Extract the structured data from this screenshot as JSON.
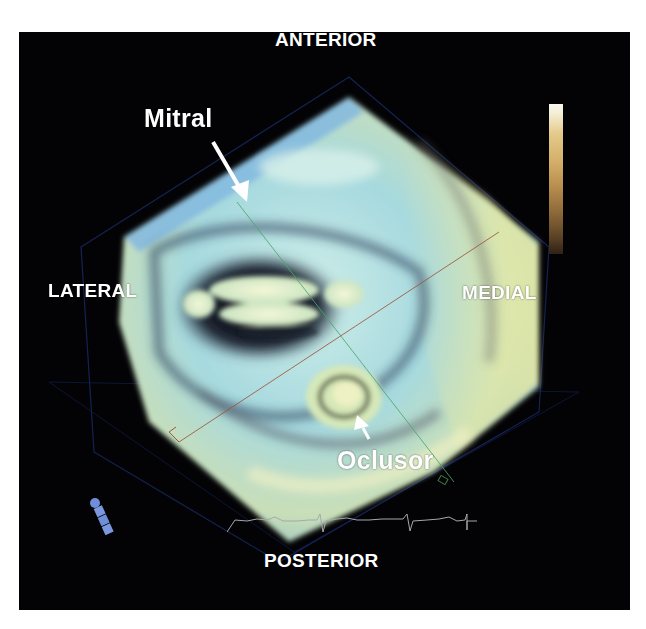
{
  "figure": {
    "background_color": "#030305",
    "labels": {
      "anterior": "ANTERIOR",
      "posterior": "POSTERIOR",
      "lateral": "LATERAL",
      "medial": "MEDIAL"
    },
    "annotations": {
      "mitral": "Mitral",
      "occluder": "Oclusor"
    },
    "colorbar": {
      "top_color": "#fbf8ef",
      "bottom_color": "#2f2215"
    },
    "colors": {
      "volume_cyan": "#a9dce0",
      "volume_yellow": "#e8eab0",
      "green_plane_line": "#4aa86a",
      "red_plane_line": "#a0553a",
      "bounding_box": "#1a2a66"
    }
  }
}
